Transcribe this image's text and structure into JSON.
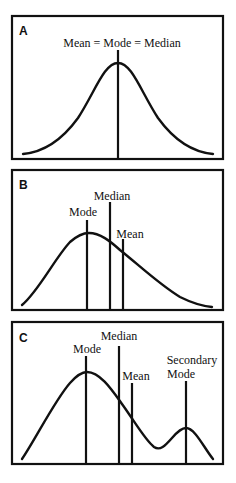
{
  "panels": [
    {
      "label": "A",
      "annotations": {
        "combined": "Mean = Mode = Median"
      },
      "description": "Symmetric unimodal distribution"
    },
    {
      "label": "B",
      "annotations": {
        "mode": "Mode",
        "median": "Median",
        "mean": "Mean"
      },
      "description": "Right-skewed unimodal distribution"
    },
    {
      "label": "C",
      "annotations": {
        "mode": "Mode",
        "median": "Median",
        "mean": "Mean",
        "secondary_mode_line1": "Secondary",
        "secondary_mode_line2": "Mode"
      },
      "description": "Bimodal distribution with secondary mode"
    }
  ],
  "colors": {
    "stroke": "#111111",
    "background": "#ffffff"
  }
}
